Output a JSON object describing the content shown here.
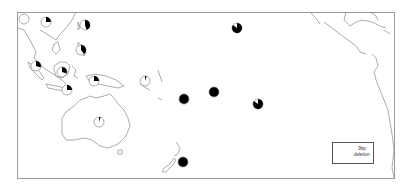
{
  "map": {
    "region": "Asia-Pacific / Pacific Ocean",
    "legend": {
      "label_line1": "9bp",
      "label_line2": "deletion",
      "marker": "half-filled pie (black = 9bp deletion, white = no deletion)"
    },
    "markers": [
      {
        "id": "m1",
        "x": 24,
        "y": 19,
        "fraction": 0.0
      },
      {
        "id": "m2",
        "x": 46,
        "y": 22,
        "fraction": 0.25
      },
      {
        "id": "m3",
        "x": 85,
        "y": 25,
        "fraction": 0.45
      },
      {
        "id": "m4",
        "x": 81,
        "y": 50,
        "fraction": 0.4
      },
      {
        "id": "m5",
        "x": 36,
        "y": 66,
        "fraction": 0.3
      },
      {
        "id": "m6",
        "x": 62,
        "y": 72,
        "fraction": 0.3
      },
      {
        "id": "m7",
        "x": 94,
        "y": 81,
        "fraction": 0.25
      },
      {
        "id": "m8",
        "x": 67,
        "y": 90,
        "fraction": 0.25
      },
      {
        "id": "m9",
        "x": 145,
        "y": 81,
        "fraction": 0.05
      },
      {
        "id": "m10",
        "x": 237,
        "y": 28,
        "fraction": 0.85
      },
      {
        "id": "m11",
        "x": 184,
        "y": 99,
        "fraction": 1.0
      },
      {
        "id": "m12",
        "x": 214,
        "y": 92,
        "fraction": 1.0
      },
      {
        "id": "m13",
        "x": 258,
        "y": 104,
        "fraction": 0.85
      },
      {
        "id": "m14",
        "x": 183,
        "y": 162,
        "fraction": 1.0
      },
      {
        "id": "m15",
        "x": 99,
        "y": 122,
        "fraction": 0.05
      }
    ],
    "colors": {
      "fill": "#000000",
      "empty": "#ffffff",
      "outline": "#8a8a8a",
      "frame": "#9a9a9a"
    }
  }
}
